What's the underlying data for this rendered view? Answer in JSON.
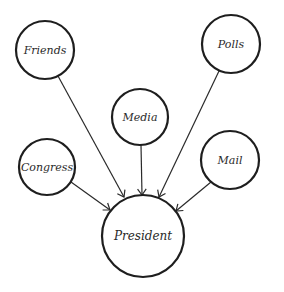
{
  "diagram": {
    "type": "influence-diagram",
    "colors": {
      "stroke": "#1e1e1e",
      "edge": "#2a2a2a",
      "text": "#2a2a2a",
      "background": "#ffffff"
    },
    "nodes": [
      {
        "id": "friends",
        "label": "Friends",
        "cx": 45,
        "cy": 50,
        "r": 29
      },
      {
        "id": "polls",
        "label": "Polls",
        "cx": 231,
        "cy": 44,
        "r": 29
      },
      {
        "id": "media",
        "label": "Media",
        "cx": 140,
        "cy": 117,
        "r": 28
      },
      {
        "id": "congress",
        "label": "Congress",
        "cx": 47,
        "cy": 167,
        "r": 28
      },
      {
        "id": "mail",
        "label": "Mail",
        "cx": 230,
        "cy": 160,
        "r": 29
      },
      {
        "id": "president",
        "label": "President",
        "cx": 143,
        "cy": 236,
        "r": 41
      }
    ],
    "edges": [
      {
        "from": "friends",
        "to": "president",
        "x1": 58,
        "y1": 76,
        "x2": 124,
        "y2": 197
      },
      {
        "from": "media",
        "to": "president",
        "x1": 141,
        "y1": 145,
        "x2": 142,
        "y2": 195
      },
      {
        "from": "polls",
        "to": "president",
        "x1": 219,
        "y1": 71,
        "x2": 159,
        "y2": 197
      },
      {
        "from": "congress",
        "to": "president",
        "x1": 71,
        "y1": 182,
        "x2": 110,
        "y2": 210
      },
      {
        "from": "mail",
        "to": "president",
        "x1": 211,
        "y1": 182,
        "x2": 176,
        "y2": 211
      }
    ]
  }
}
